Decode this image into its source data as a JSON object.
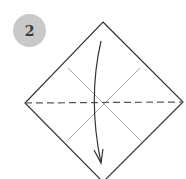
{
  "diagram": {
    "step_number": "2",
    "colors": {
      "badge": "#c9c9c9",
      "badge_text": "#3a3a3a",
      "outline": "#333333",
      "crease": "#a8a8a8",
      "fold_line": "#555555",
      "arrow": "#333333"
    },
    "paper": {
      "shape": "diamond",
      "vertices": {
        "top": [
          103,
          22
        ],
        "right": [
          183,
          102
        ],
        "bottom": [
          103,
          182
        ],
        "left": [
          25,
          103
        ]
      }
    },
    "creases": [
      {
        "from": [
          68,
          68
        ],
        "to": [
          140,
          140
        ],
        "style": "solid-light"
      },
      {
        "from": [
          140,
          68
        ],
        "to": [
          68,
          140
        ],
        "style": "solid-light"
      }
    ],
    "fold_line": {
      "from": [
        25,
        103
      ],
      "to": [
        183,
        102
      ],
      "style": "dashed",
      "label": "valley fold"
    },
    "arrow": {
      "from": [
        101,
        41
      ],
      "to": [
        101,
        163
      ],
      "direction": "down",
      "label": "fold top down"
    }
  }
}
